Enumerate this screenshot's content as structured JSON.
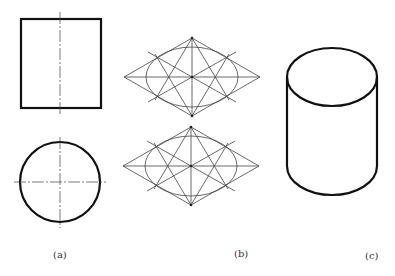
{
  "figure": {
    "panels": [
      {
        "id": "a",
        "label": "(a)",
        "description": "Orthographic views of a cylinder: front view (rectangle) and top view (circle) with center lines"
      },
      {
        "id": "b",
        "label": "(b)",
        "description": "Four-center approximate ellipse construction inside isometric rhombi"
      },
      {
        "id": "c",
        "label": "(c)",
        "description": "Isometric drawing of a cylinder"
      }
    ],
    "colors": {
      "outline": "#111111",
      "construction": "#444444",
      "label": "#333333",
      "background": "#ffffff"
    }
  }
}
